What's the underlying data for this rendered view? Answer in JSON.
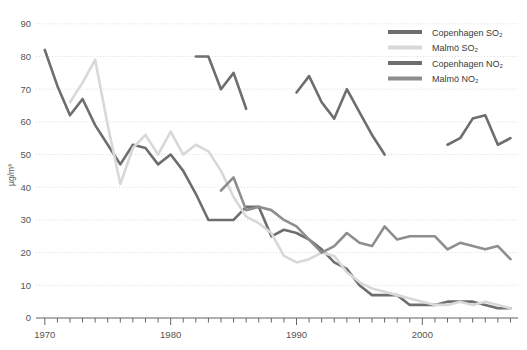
{
  "chart_data": {
    "type": "line",
    "title": "",
    "subtitle": "",
    "xlabel": "",
    "ylabel": "µg/m³",
    "xlim": [
      1969.3,
      2007.6
    ],
    "ylim": [
      0,
      93
    ],
    "yticks": [
      0,
      10,
      20,
      30,
      40,
      50,
      60,
      70,
      80,
      90
    ],
    "ytick_labels": [
      "0",
      "10",
      "20",
      "30",
      "40",
      "50",
      "60",
      "70",
      "80",
      "90"
    ],
    "xticks": [
      1970,
      1980,
      1990,
      2000
    ],
    "xtick_labels": [
      "1970",
      "1980",
      "1990",
      "2000"
    ],
    "minor_xticks_every": 1,
    "grid": "horizontal-dotted",
    "legend_position": "top-right",
    "series": [
      {
        "name": "Copenhagen SO₂",
        "color": "#6e6e6e",
        "width": 2.6,
        "x": [
          1970,
          1971,
          1972,
          1973,
          1974,
          1975,
          1976,
          1977,
          1978,
          1979,
          1980,
          1981,
          1982,
          1983,
          1984,
          1985,
          1986,
          1987,
          1988,
          1989,
          1990,
          1991,
          1992,
          1993,
          1994,
          1995,
          1996,
          1997,
          1998,
          1999,
          2000,
          2001,
          2002,
          2003,
          2004,
          2005,
          2006,
          2007
        ],
        "values": [
          82,
          71,
          62,
          67,
          59,
          53,
          47,
          53,
          52,
          47,
          50,
          45,
          38,
          30,
          30,
          30,
          34,
          34,
          25,
          27,
          26,
          24,
          21,
          17,
          15,
          10,
          7,
          7,
          7,
          4,
          4,
          4,
          5,
          5,
          5,
          4,
          3,
          3
        ]
      },
      {
        "name": "Malmö SO₂",
        "color": "#d8d8d8",
        "width": 2.6,
        "x": [
          1972,
          1973,
          1974,
          1975,
          1976,
          1977,
          1978,
          1979,
          1980,
          1981,
          1982,
          1983,
          1984,
          1985,
          1986,
          1987,
          1988,
          1989,
          1990,
          1991,
          1992,
          1993,
          1994,
          1995,
          1996,
          1997,
          1998,
          1999,
          2000,
          2001,
          2002,
          2003,
          2004,
          2005,
          2006,
          2007
        ],
        "values": [
          66,
          72,
          79,
          59,
          41,
          52,
          56,
          50,
          57,
          50,
          53,
          51,
          45,
          37,
          31,
          29,
          26,
          19,
          17,
          18,
          20,
          19,
          14,
          11,
          9,
          8,
          7,
          6,
          5,
          4,
          4,
          5,
          4,
          5,
          4,
          3
        ]
      },
      {
        "name": "Copenhagen NO₂",
        "color": "#6e6e6e",
        "width": 2.6,
        "segments": [
          {
            "x": [
              1982,
              1983,
              1984,
              1985,
              1986
            ],
            "values": [
              80,
              80,
              70,
              75,
              64
            ]
          },
          {
            "x": [
              1990,
              1991,
              1992,
              1993,
              1994,
              1995,
              1996,
              1997
            ],
            "values": [
              69,
              74,
              66,
              61,
              70,
              63,
              56,
              50
            ]
          },
          {
            "x": [
              2002,
              2003,
              2004,
              2005,
              2006,
              2007
            ],
            "values": [
              53,
              55,
              61,
              62,
              53,
              55
            ]
          }
        ]
      },
      {
        "name": "Malmö NO₂",
        "color": "#8e8e8e",
        "width": 2.6,
        "x": [
          1984,
          1985,
          1986,
          1987,
          1988,
          1989,
          1990,
          1991,
          1992,
          1993,
          1994,
          1995,
          1996,
          1997,
          1998,
          1999,
          2000,
          2001,
          2002,
          2003,
          2004,
          2005,
          2006,
          2007
        ],
        "values": [
          39,
          43,
          33,
          34,
          33,
          30,
          28,
          24,
          20,
          22,
          26,
          23,
          22,
          28,
          24,
          25,
          25,
          25,
          21,
          23,
          22,
          21,
          22,
          18
        ]
      }
    ],
    "legend": [
      {
        "label": "Copenhagen SO₂",
        "color": "#6e6e6e"
      },
      {
        "label": "Malmö SO₂",
        "color": "#d8d8d8"
      },
      {
        "label": "Copenhagen NO₂",
        "color": "#6e6e6e"
      },
      {
        "label": "Malmö NO₂",
        "color": "#8e8e8e"
      }
    ],
    "colors": {
      "background": "#ffffff",
      "grid": "#d9d9d9",
      "axis": "#666666",
      "text": "#555555"
    }
  }
}
